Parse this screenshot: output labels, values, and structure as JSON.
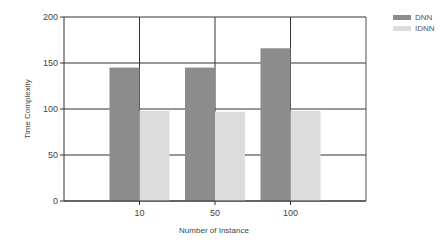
{
  "chart_data": {
    "type": "bar",
    "title": "",
    "xlabel": "Number of Instance",
    "ylabel": "Time Complexity",
    "categories": [
      "10",
      "50",
      "100"
    ],
    "series": [
      {
        "name": "DNN",
        "color": "#8c8c8c",
        "values": [
          145,
          145,
          166
        ]
      },
      {
        "name": "IDNN",
        "color": "#dcdcdc",
        "values": [
          98,
          97,
          98
        ]
      }
    ],
    "ylim": [
      0,
      200
    ],
    "yticks": [
      0,
      50,
      100,
      150,
      200
    ],
    "grid": true,
    "legend_position": "top-right"
  },
  "legend": {
    "items": [
      {
        "label": "DNN",
        "color": "#8c8c8c"
      },
      {
        "label": "IDNN",
        "color": "#dcdcdc"
      }
    ]
  }
}
